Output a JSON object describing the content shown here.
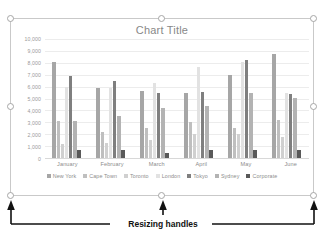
{
  "chart_object": {
    "title": "Chart Title",
    "handles": [
      {
        "name": "handle-top-left"
      },
      {
        "name": "handle-top-middle"
      },
      {
        "name": "handle-top-right"
      },
      {
        "name": "handle-middle-left"
      },
      {
        "name": "handle-middle-right"
      },
      {
        "name": "handle-bottom-left"
      },
      {
        "name": "handle-bottom-middle"
      },
      {
        "name": "handle-bottom-right"
      }
    ]
  },
  "annotation": {
    "label": "Resizing handles"
  },
  "chart_data": {
    "type": "bar",
    "title": "Chart Title",
    "xlabel": "",
    "ylabel": "",
    "ylim": [
      0,
      10000
    ],
    "ytick_labels": [
      "10,000",
      "9,000",
      "8,000",
      "7,000",
      "6,000",
      "5,000",
      "4,000",
      "3,000",
      "2,000",
      "1,000",
      "0"
    ],
    "yticks": [
      10000,
      9000,
      8000,
      7000,
      6000,
      5000,
      4000,
      3000,
      2000,
      1000,
      0
    ],
    "grid": true,
    "legend_position": "bottom",
    "categories": [
      "January",
      "February",
      "March",
      "April",
      "May",
      "June"
    ],
    "series": [
      {
        "name": "New York",
        "color": "#a6a6a6",
        "values": [
          8050,
          5900,
          5600,
          5500,
          6950,
          8700
        ]
      },
      {
        "name": "Cape Town",
        "color": "#bfbfbf",
        "values": [
          3100,
          2200,
          2500,
          3000,
          2500,
          3200
        ]
      },
      {
        "name": "Toronto",
        "color": "#d0d0d0",
        "values": [
          1200,
          1300,
          1550,
          2000,
          2050,
          1750
        ]
      },
      {
        "name": "London",
        "color": "#e2e2e2",
        "values": [
          6000,
          5900,
          6300,
          7650,
          8050,
          5450
        ]
      },
      {
        "name": "Tokyo",
        "color": "#7f7f7f",
        "values": [
          6900,
          6450,
          5500,
          5550,
          8200,
          5400
        ]
      },
      {
        "name": "Sydney",
        "color": "#b3b3b3",
        "values": [
          3150,
          3500,
          4200,
          4350,
          5450,
          5050
        ]
      },
      {
        "name": "Corporate",
        "color": "#595959",
        "values": [
          700,
          650,
          450,
          700,
          650,
          700
        ]
      }
    ]
  }
}
